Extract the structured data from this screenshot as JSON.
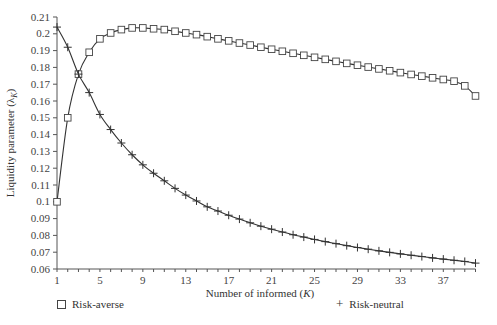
{
  "chart_data": {
    "type": "line",
    "title": "",
    "xlabel": "Number of informed (K)",
    "ylabel": "Liquidity parameter (λ_K)",
    "xlim": [
      1,
      40
    ],
    "ylim": [
      0.06,
      0.21
    ],
    "x_ticks": [
      1,
      5,
      9,
      13,
      17,
      21,
      25,
      29,
      33,
      37
    ],
    "y_ticks": [
      0.06,
      0.07,
      0.08,
      0.09,
      0.1,
      0.11,
      0.12,
      0.13,
      0.14,
      0.15,
      0.16,
      0.17,
      0.18,
      0.19,
      0.2,
      0.21
    ],
    "grid": false,
    "legend_position": "bottom",
    "x": [
      1,
      2,
      3,
      4,
      5,
      6,
      7,
      8,
      9,
      10,
      11,
      12,
      13,
      14,
      15,
      16,
      17,
      18,
      19,
      20,
      21,
      22,
      23,
      24,
      25,
      26,
      27,
      28,
      29,
      30,
      31,
      32,
      33,
      34,
      35,
      36,
      37,
      38,
      39,
      40
    ],
    "series": [
      {
        "name": "Risk-averse",
        "marker": "square",
        "values": [
          0.1,
          0.15,
          0.176,
          0.189,
          0.197,
          0.2005,
          0.2025,
          0.2035,
          0.2035,
          0.203,
          0.2025,
          0.2015,
          0.2005,
          0.1995,
          0.1983,
          0.197,
          0.1958,
          0.1945,
          0.1933,
          0.192,
          0.1908,
          0.1896,
          0.1884,
          0.1872,
          0.186,
          0.1848,
          0.1836,
          0.1824,
          0.1813,
          0.1802,
          0.1791,
          0.178,
          0.1769,
          0.1758,
          0.1748,
          0.1738,
          0.1728,
          0.1718,
          0.169,
          0.163
        ]
      },
      {
        "name": "Risk-neutral",
        "marker": "plus",
        "values": [
          0.204,
          0.192,
          0.176,
          0.165,
          0.152,
          0.143,
          0.135,
          0.128,
          0.122,
          0.117,
          0.1125,
          0.108,
          0.104,
          0.1005,
          0.097,
          0.0945,
          0.092,
          0.0897,
          0.0875,
          0.0855,
          0.0837,
          0.082,
          0.0804,
          0.079,
          0.0776,
          0.0763,
          0.0751,
          0.0739,
          0.0728,
          0.0718,
          0.0708,
          0.0699,
          0.069,
          0.0682,
          0.0674,
          0.0666,
          0.0659,
          0.0652,
          0.0645,
          0.0635
        ]
      }
    ]
  },
  "axes": {
    "x_label_text": "Number of informed (",
    "x_label_var": "K",
    "x_label_close": ")",
    "y_label_text": "Liquidity parameter (λ",
    "y_label_sub": "K",
    "y_label_close": ")"
  },
  "legend": {
    "items": [
      {
        "label": "Risk-averse",
        "marker": "square"
      },
      {
        "label": "Risk-neutral",
        "marker": "plus"
      }
    ]
  }
}
